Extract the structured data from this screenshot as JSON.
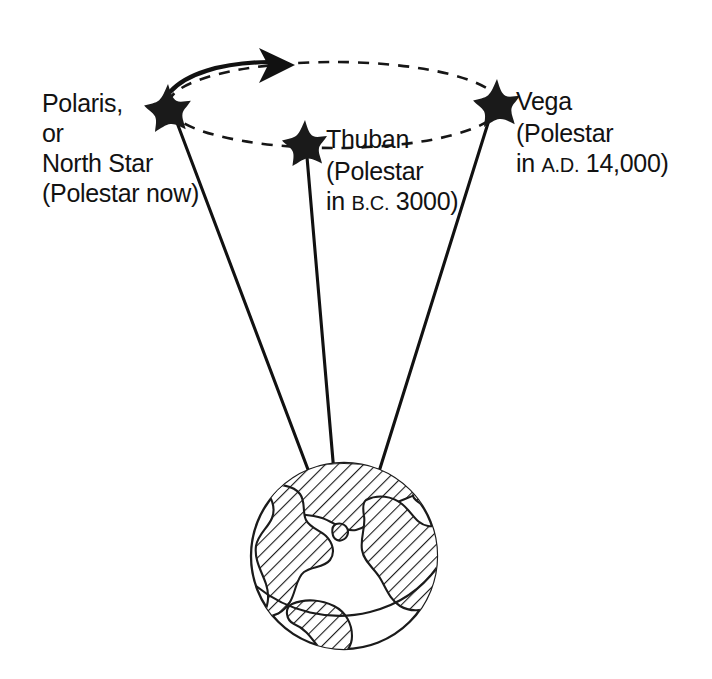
{
  "figure": {
    "background_color": "#ffffff",
    "ink_color": "#111111"
  },
  "orbit": {
    "name": "precession-circle",
    "style": "dashed ellipse with solid arrowed arc at upper left",
    "direction_marker": "arrowhead pointing clockwise (to the right) along the top of the ellipse",
    "center_x": 334,
    "center_y": 105,
    "radius_x": 166,
    "radius_y": 43
  },
  "stars": [
    {
      "id": "polaris",
      "icon": "star-icon",
      "x": 168,
      "y": 108,
      "label_lines": [
        "Polaris,",
        "or",
        "North Star",
        "(Polestar now)"
      ],
      "label_align": "right-of-text",
      "era_prefix": "",
      "era_value": ""
    },
    {
      "id": "thuban",
      "icon": "star-icon",
      "x": 305,
      "y": 143,
      "label_lines": [
        "Thuban",
        "(Polestar",
        "in B.C. 3000)"
      ],
      "label_align": "left",
      "era_prefix": "B.C.",
      "era_value": "3000"
    },
    {
      "id": "vega",
      "icon": "star-icon",
      "x": 497,
      "y": 103,
      "label_lines": [
        "Vega",
        "(Polestar",
        "in A.D. 14,000)"
      ],
      "label_align": "left",
      "era_prefix": "A.D.",
      "era_value": "14,000"
    }
  ],
  "labels": {
    "polaris": {
      "line1": "Polaris,",
      "line2": "or",
      "line3": "North Star",
      "line4": "(Polestar now)"
    },
    "thuban": {
      "line1": "Thuban",
      "line2": "(Polestar",
      "line3_prefix": "in ",
      "line3_abbrev": "B.C.",
      "line3_suffix": " 3000)"
    },
    "vega": {
      "line1": "Vega",
      "line2": "(Polestar",
      "line3_prefix": "in ",
      "line3_abbrev": "A.D.",
      "line3_suffix": " 14,000)"
    }
  },
  "earth": {
    "name": "earth-globe",
    "center_x": 344,
    "center_y": 556,
    "radius": 94,
    "fill": "#ffffff",
    "land_style": "diagonal hatching",
    "axis_lines": 3
  },
  "sight_lines": [
    {
      "id": "polaris-sight-line",
      "from_star": "polaris",
      "x1": 176,
      "y1": 120,
      "x2": 318,
      "y2": 496
    },
    {
      "id": "thuban-sight-line",
      "from_star": "thuban",
      "x1": 307,
      "y1": 157,
      "x2": 336,
      "y2": 496
    },
    {
      "id": "vega-sight-line",
      "from_star": "vega",
      "x1": 489,
      "y1": 120,
      "x2": 372,
      "y2": 494
    }
  ]
}
